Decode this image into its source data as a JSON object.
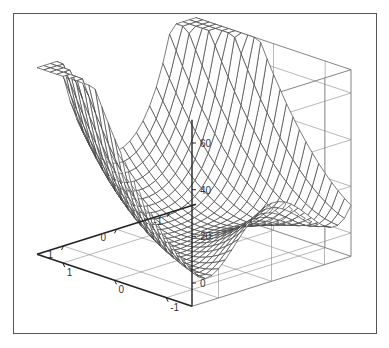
{
  "chart_data": {
    "type": "surface3d",
    "title": "",
    "function": "z = 10*(y - x^2)^2 + (1 - x)^2  (Rosenbrock-type saddle/valley surface)",
    "x_range": [
      -1.5,
      1.5
    ],
    "y_range": [
      -1.5,
      1.5
    ],
    "z_range": [
      -10,
      70
    ],
    "grid_resolution": 24,
    "x_axis": {
      "label": "",
      "ticks": [
        -1,
        0,
        1
      ],
      "tick_labels": [
        "-1",
        "0",
        "1"
      ]
    },
    "y_axis": {
      "label": "",
      "ticks": [
        -1,
        0,
        1
      ],
      "tick_labels": [
        "1",
        "0",
        "-1"
      ]
    },
    "z_axis": {
      "label": "",
      "ticks": [
        0,
        20,
        40,
        60
      ],
      "tick_labels": [
        "0",
        "20",
        "40",
        "60"
      ]
    },
    "style": {
      "wireframe": true,
      "hidden_line": true,
      "box": true,
      "grid": true,
      "line_color": "#444444",
      "fill_color": "#ffffff",
      "box_color": "#666666"
    }
  }
}
